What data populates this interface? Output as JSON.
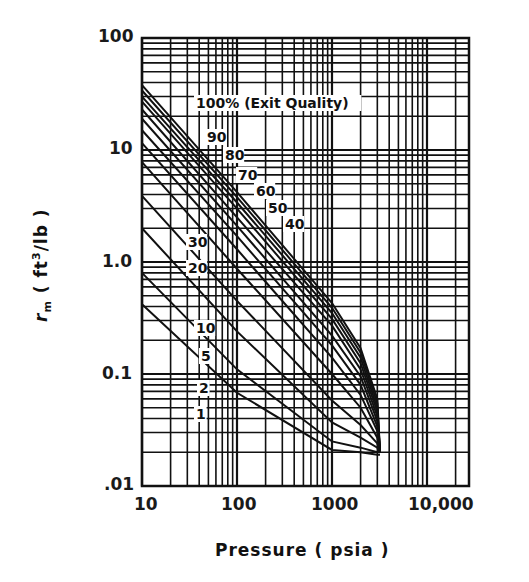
{
  "chart_data": {
    "type": "line",
    "title": "",
    "xlabel": "Pressure (psia)",
    "ylabel": "r_m (ft3/lb)",
    "xscale": "log",
    "yscale": "log",
    "xlim": [
      10,
      20000
    ],
    "ylim": [
      0.01,
      100
    ],
    "grid": true,
    "x_ticks": [
      "10",
      "100",
      "1000",
      "10,000"
    ],
    "y_ticks": [
      "100",
      "10",
      "1.0",
      "0.1",
      ".01"
    ],
    "annotation": "100% (Exit Quality)",
    "series": [
      {
        "name": "100%",
        "x": [
          10,
          100,
          1000,
          2000,
          3000,
          3200
        ],
        "y": [
          38,
          4.2,
          0.43,
          0.17,
          0.06,
          0.02
        ]
      },
      {
        "name": "90%",
        "x": [
          10,
          100,
          1000,
          2000,
          3000,
          3200
        ],
        "y": [
          34,
          3.8,
          0.39,
          0.155,
          0.055,
          0.02
        ]
      },
      {
        "name": "80%",
        "x": [
          10,
          100,
          1000,
          2000,
          3000,
          3200
        ],
        "y": [
          30,
          3.4,
          0.35,
          0.14,
          0.05,
          0.02
        ]
      },
      {
        "name": "70%",
        "x": [
          10,
          100,
          1000,
          2000,
          3000,
          3200
        ],
        "y": [
          27,
          3.0,
          0.31,
          0.125,
          0.046,
          0.02
        ]
      },
      {
        "name": "60%",
        "x": [
          10,
          100,
          1000,
          2000,
          3000,
          3200
        ],
        "y": [
          23,
          2.5,
          0.27,
          0.11,
          0.042,
          0.02
        ]
      },
      {
        "name": "50%",
        "x": [
          10,
          100,
          1000,
          2000,
          3000,
          3200
        ],
        "y": [
          19,
          2.1,
          0.22,
          0.095,
          0.038,
          0.02
        ]
      },
      {
        "name": "40%",
        "x": [
          10,
          100,
          1000,
          2000,
          3000,
          3200
        ],
        "y": [
          15,
          1.7,
          0.18,
          0.08,
          0.034,
          0.02
        ]
      },
      {
        "name": "30%",
        "x": [
          10,
          100,
          1000,
          2000,
          3000,
          3200
        ],
        "y": [
          11.5,
          1.3,
          0.14,
          0.065,
          0.031,
          0.02
        ]
      },
      {
        "name": "20%",
        "x": [
          10,
          100,
          1000,
          2000,
          3000,
          3200
        ],
        "y": [
          7.8,
          0.87,
          0.1,
          0.05,
          0.027,
          0.02
        ]
      },
      {
        "name": "10%",
        "x": [
          10,
          100,
          1000,
          2000,
          3000,
          3200
        ],
        "y": [
          3.9,
          0.45,
          0.058,
          0.035,
          0.024,
          0.02
        ]
      },
      {
        "name": "5%",
        "x": [
          10,
          100,
          1000,
          2000,
          3000,
          3200
        ],
        "y": [
          2.0,
          0.24,
          0.037,
          0.027,
          0.022,
          0.02
        ]
      },
      {
        "name": "2%",
        "x": [
          10,
          100,
          1000,
          2000,
          3000,
          3200
        ],
        "y": [
          0.8,
          0.11,
          0.025,
          0.022,
          0.02,
          0.02
        ]
      },
      {
        "name": "1%",
        "x": [
          10,
          100,
          1000,
          2000,
          3000,
          3200
        ],
        "y": [
          0.42,
          0.068,
          0.021,
          0.02,
          0.019,
          0.019
        ]
      }
    ],
    "curve_labels": [
      "100% (Exit Quality)",
      "90",
      "80",
      "70",
      "60",
      "50",
      "40",
      "30",
      "20",
      "10",
      "5",
      "2",
      "1"
    ]
  },
  "axis": {
    "x_title": "Pressure   ( psia )",
    "y_title": "r",
    "y_title_sub": "m",
    "y_title_rest": " ( ft",
    "y_title_sup": "3",
    "y_title_end": "/lb )"
  }
}
